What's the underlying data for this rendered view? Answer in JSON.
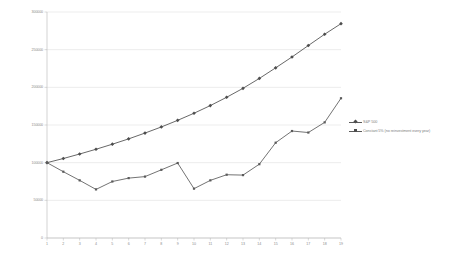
{
  "chart_data": {
    "type": "line",
    "title": "",
    "subtitle": "",
    "xlabel": "",
    "ylabel": "",
    "xlim": [
      1,
      19
    ],
    "ylim": [
      0,
      300000
    ],
    "grid": true,
    "legend_position": "right",
    "x": [
      1,
      2,
      3,
      4,
      5,
      6,
      7,
      8,
      9,
      10,
      11,
      12,
      13,
      14,
      15,
      16,
      17,
      18,
      19
    ],
    "xtick_labels": [
      "1",
      "2",
      "3",
      "4",
      "5",
      "6",
      "7",
      "8",
      "9",
      "10",
      "11",
      "12",
      "13",
      "14",
      "15",
      "16",
      "17",
      "18",
      "19"
    ],
    "ytick_labels": [
      "0",
      "50000",
      "100000",
      "150000",
      "200000",
      "250000",
      "300000"
    ],
    "ytick_values": [
      0,
      50000,
      100000,
      150000,
      200000,
      250000,
      300000
    ],
    "series": [
      {
        "name": "S&P 500",
        "color": "#4d4d4d",
        "marker": "diamond",
        "values": [
          100000,
          105500,
          111500,
          117800,
          124500,
          131600,
          139300,
          147400,
          156200,
          165600,
          175800,
          186800,
          198700,
          211800,
          225900,
          240300,
          255500,
          270500,
          284500
        ]
      },
      {
        "name": "Constant 5% (no reinvestment every year)",
        "color": "#5a5a5a",
        "marker": "square",
        "values": [
          100000,
          88000,
          76500,
          64500,
          75000,
          79500,
          81500,
          90500,
          99500,
          65500,
          76500,
          84000,
          83500,
          98000,
          126500,
          142000,
          140000,
          153500,
          185500
        ]
      }
    ]
  },
  "legend": {
    "items": [
      {
        "label": "S&P 500",
        "marker": "diamond"
      },
      {
        "label": "Constant 5% (no reinvestment every year)",
        "marker": "square"
      }
    ]
  },
  "axes": {
    "y_axis_label_color": "#8a8a8a",
    "x_axis_label_color": "#8a8a8a",
    "grid_color": "#d9d9d9",
    "axis_color": "#b5b5b5"
  }
}
